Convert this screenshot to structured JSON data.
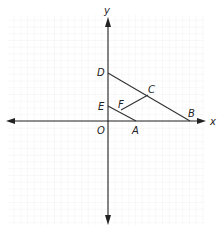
{
  "diagram": {
    "type": "coordinate-plane-geometry",
    "axes": {
      "x_label": "x",
      "y_label": "y",
      "origin_label": "O"
    },
    "points": [
      {
        "name": "D",
        "label": "D",
        "on": "y-axis"
      },
      {
        "name": "E",
        "label": "E",
        "on": "y-axis"
      },
      {
        "name": "O",
        "label": "O",
        "on": "origin"
      },
      {
        "name": "A",
        "label": "A",
        "on": "x-axis"
      },
      {
        "name": "B",
        "label": "B",
        "on": "x-axis"
      },
      {
        "name": "C",
        "label": "C",
        "on": "segment DB"
      },
      {
        "name": "F",
        "label": "F",
        "on": "segment EA"
      }
    ],
    "segments": [
      "DB",
      "EA",
      "FC"
    ],
    "colors": {
      "axis": "#222222",
      "segment": "#333333",
      "grid": "#e3e3e3"
    }
  }
}
